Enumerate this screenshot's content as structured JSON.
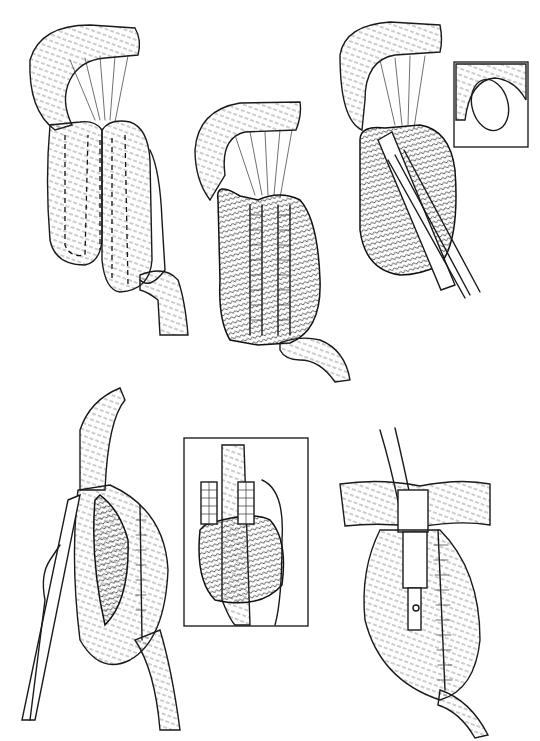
{
  "figure": {
    "background": "#ffffff",
    "ink_color": "#1a1a1a",
    "panels": [
      {
        "id": "step-1",
        "description": "bowel loops folded in U-shape with dashed suture lines",
        "has_inset": false
      },
      {
        "id": "step-2",
        "description": "opened bowel loops sutured side-to-side forming pouch",
        "has_inset": false
      },
      {
        "id": "step-3",
        "description": "stapler inserted into pouch",
        "has_inset": true
      },
      {
        "id": "step-4",
        "description": "pouch opened with stapler alongside",
        "has_inset": false
      },
      {
        "id": "step-5-inset",
        "description": "boxed detail of stapled pouch",
        "has_inset": false
      },
      {
        "id": "step-6",
        "description": "completed pouch with tube passing through abdominal wall",
        "has_inset": false
      }
    ],
    "labels": []
  }
}
